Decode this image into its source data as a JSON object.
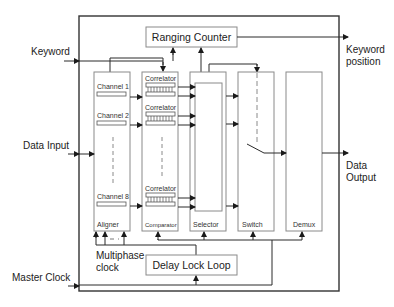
{
  "diagram": {
    "inputs": {
      "keyword": "Keyword",
      "data_input": "Data Input",
      "master_clock": "Master Clock"
    },
    "outputs": {
      "keyword_position_line1": "Keyword",
      "keyword_position_line2": "position",
      "data_output_line1": "Data",
      "data_output_line2": "Output"
    },
    "blocks": {
      "ranging_counter": "Ranging Counter",
      "delay_lock_loop": "Delay Lock Loop",
      "aligner": "Aligner",
      "comparator": "Comparator",
      "selector": "Selector",
      "switch": "Switch",
      "demux": "Demux"
    },
    "channels": [
      "Channel 1",
      "Channel 2",
      "Channel 8"
    ],
    "correlators": [
      "Correlator",
      "Correlator",
      "Correlator"
    ],
    "multiphase_clock_line1": "Multiphase",
    "multiphase_clock_line2": "clock",
    "colors": {
      "outer_frame": "#333333",
      "block_border": "#8a8a8a",
      "line": "#2a2a2a",
      "dashed": "#8a8a8a"
    }
  }
}
